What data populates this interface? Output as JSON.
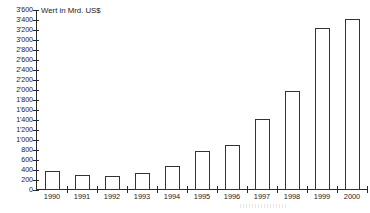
{
  "chart_data": {
    "type": "bar",
    "title": "Wert in Mrd. US$",
    "xlabel": "",
    "ylabel": "Wert in Mrd. US$",
    "categories": [
      "1990",
      "1991",
      "1992",
      "1993",
      "1994",
      "1995",
      "1996",
      "1997",
      "1998",
      "1999",
      "2000"
    ],
    "values": [
      380,
      295,
      280,
      350,
      490,
      780,
      900,
      1430,
      1990,
      3250,
      3430
    ],
    "ylim": [
      0,
      3600
    ],
    "y_tick_step": 200,
    "y_ticks": [
      0,
      200,
      400,
      600,
      800,
      1000,
      1200,
      1400,
      1600,
      1800,
      2000,
      2200,
      2400,
      2600,
      2800,
      3000,
      3200,
      3400,
      3600
    ],
    "y_tick_labels": [
      "0",
      "200",
      "400",
      "600",
      "800",
      "1'000",
      "1'200",
      "1'400",
      "1'600",
      "1'800",
      "2'000",
      "2'200",
      "2'400",
      "2'600",
      "2'800",
      "3'000",
      "3'200",
      "3'400",
      "3'600"
    ],
    "grid": false,
    "legend": "none",
    "bar_fill_color": "#ffffff",
    "bar_edge_color": "#333333",
    "axis_color": "#2a2a2a",
    "thousands_separator": "'"
  }
}
